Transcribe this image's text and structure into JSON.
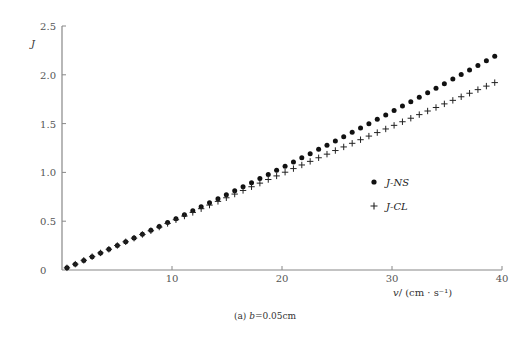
{
  "chart_data": {
    "type": "scatter",
    "title": "",
    "caption": "(a) b=0.05cm",
    "caption_prefix": "(a)",
    "caption_var": "b",
    "caption_value": "=0.05cm",
    "xlabel": "v/(cm·s⁻¹)",
    "xlabel_var": "v",
    "xlabel_unit": "/ (cm · s⁻¹)",
    "ylabel": "J",
    "xlim": [
      0,
      40
    ],
    "ylim": [
      0,
      2.5
    ],
    "xticks": [
      10,
      20,
      30,
      40
    ],
    "xtick_labels": [
      "10",
      "20",
      "30",
      "40"
    ],
    "yticks": [
      0,
      0.5,
      1.0,
      1.5,
      2.0,
      2.5
    ],
    "ytick_labels": [
      "0",
      "0.5",
      "1.0",
      "1.5",
      "2.0",
      "2.5"
    ],
    "origin_label": "0",
    "grid": false,
    "legend_position": "right-center",
    "x": [
      0.45,
      1.21,
      1.98,
      2.74,
      3.5,
      4.26,
      5.03,
      5.79,
      6.55,
      7.31,
      8.08,
      8.84,
      9.6,
      10.36,
      11.13,
      11.89,
      12.65,
      13.41,
      14.18,
      14.94,
      15.7,
      16.46,
      17.23,
      17.99,
      18.75,
      19.51,
      20.28,
      21.04,
      21.8,
      22.56,
      23.33,
      24.09,
      24.85,
      25.61,
      26.38,
      27.14,
      27.9,
      28.66,
      29.43,
      30.19,
      30.95,
      31.71,
      32.48,
      33.24,
      34.0,
      34.76,
      35.53,
      36.29,
      37.05,
      37.81,
      38.58,
      39.34
    ],
    "series": [
      {
        "name": "J-NS",
        "marker": "dot",
        "color": "#111111",
        "values": [
          0.022,
          0.06,
          0.098,
          0.135,
          0.174,
          0.212,
          0.251,
          0.289,
          0.328,
          0.367,
          0.407,
          0.446,
          0.486,
          0.526,
          0.566,
          0.607,
          0.647,
          0.688,
          0.729,
          0.77,
          0.811,
          0.853,
          0.895,
          0.937,
          0.979,
          1.021,
          1.063,
          1.106,
          1.149,
          1.192,
          1.236,
          1.279,
          1.323,
          1.366,
          1.411,
          1.455,
          1.499,
          1.544,
          1.589,
          1.634,
          1.68,
          1.725,
          1.771,
          1.817,
          1.863,
          1.909,
          1.956,
          2.002,
          2.049,
          2.096,
          2.143,
          2.191
        ]
      },
      {
        "name": "J-CL",
        "marker": "plus",
        "color": "#222222",
        "values": [
          0.022,
          0.06,
          0.099,
          0.137,
          0.175,
          0.212,
          0.251,
          0.289,
          0.326,
          0.364,
          0.402,
          0.44,
          0.477,
          0.515,
          0.553,
          0.59,
          0.628,
          0.665,
          0.703,
          0.74,
          0.778,
          0.815,
          0.853,
          0.89,
          0.927,
          0.964,
          1.002,
          1.039,
          1.076,
          1.113,
          1.15,
          1.187,
          1.224,
          1.261,
          1.298,
          1.335,
          1.372,
          1.408,
          1.445,
          1.482,
          1.519,
          1.555,
          1.592,
          1.629,
          1.665,
          1.702,
          1.738,
          1.775,
          1.811,
          1.848,
          1.884,
          1.92
        ]
      }
    ]
  },
  "colors": {
    "axis": "#888888",
    "marker": "#111111"
  }
}
